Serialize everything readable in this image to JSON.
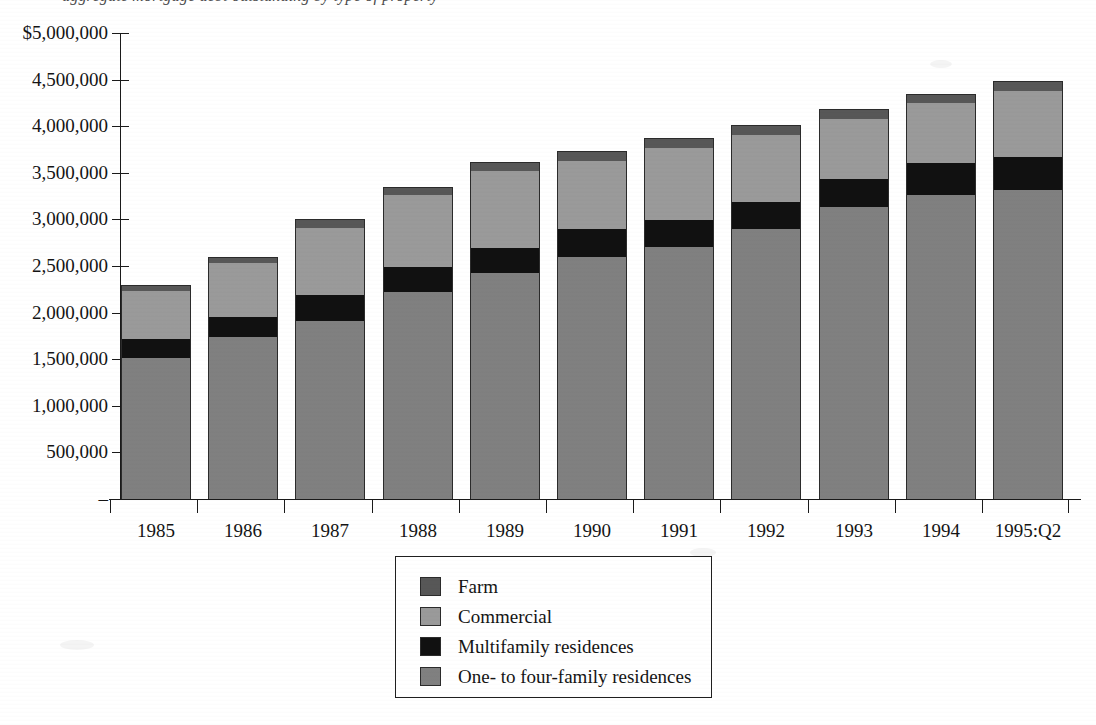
{
  "title": {
    "text_partial": "aggregate mortgage debt outstanding by type of property",
    "visible": "descenders only (cropped at top edge)"
  },
  "chart_data": {
    "type": "bar",
    "stacked": true,
    "title": "",
    "xlabel": "",
    "ylabel": "",
    "ylim": [
      0,
      5000000
    ],
    "ytick_values": [
      0,
      500000,
      1000000,
      1500000,
      2000000,
      2500000,
      3000000,
      3500000,
      4000000,
      4500000,
      5000000
    ],
    "ytick_labels": [
      "–",
      "500,000",
      "1,000,000",
      "1,500,000",
      "2,000,000",
      "2,500,000",
      "3,000,000",
      "3,500,000",
      "4,000,000",
      "4,500,000",
      "$5,000,000"
    ],
    "grid": false,
    "legend_position": "bottom-center",
    "categories": [
      "1985",
      "1986",
      "1987",
      "1988",
      "1989",
      "1990",
      "1991",
      "1992",
      "1993",
      "1994",
      "1995:Q2"
    ],
    "series": [
      {
        "name": "One- to four-family residences",
        "color": "#808080",
        "values": [
          1510000,
          1740000,
          1910000,
          2220000,
          2420000,
          2600000,
          2700000,
          2900000,
          3130000,
          3260000,
          3320000
        ]
      },
      {
        "name": "Multifamily residences",
        "color": "#111111",
        "values": [
          210000,
          210000,
          280000,
          270000,
          270000,
          300000,
          290000,
          290000,
          300000,
          340000,
          350000
        ]
      },
      {
        "name": "Commercial",
        "color": "#9a9a9a",
        "values": [
          510000,
          580000,
          720000,
          770000,
          830000,
          730000,
          780000,
          720000,
          650000,
          650000,
          710000
        ]
      },
      {
        "name": "Farm",
        "color": "#575757",
        "values": [
          70000,
          70000,
          90000,
          90000,
          100000,
          100000,
          100000,
          100000,
          100000,
          100000,
          110000
        ]
      }
    ],
    "totals": [
      2300000,
      2600000,
      3000000,
      3350000,
      3620000,
      3730000,
      3870000,
      4010000,
      4180000,
      4350000,
      4490000
    ]
  },
  "legend": {
    "entries": [
      {
        "label": "Farm",
        "color": "#575757"
      },
      {
        "label": "Commercial",
        "color": "#9a9a9a"
      },
      {
        "label": "Multifamily residences",
        "color": "#111111"
      },
      {
        "label": "One- to four-family residences",
        "color": "#808080"
      }
    ]
  },
  "colors": {
    "axis": "#1a1a1a",
    "text": "#141414",
    "background": "#ffffff",
    "farm": "#575757",
    "commercial": "#9a9a9a",
    "multifamily": "#111111",
    "one_to_four": "#808080"
  }
}
